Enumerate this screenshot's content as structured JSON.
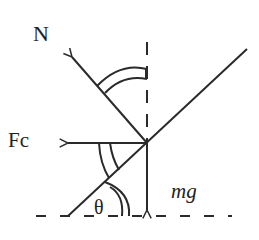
{
  "labels": {
    "normal_force": "N",
    "centripetal_force": "Fc",
    "weight": "mg",
    "angle": "θ"
  },
  "colors": {
    "stroke": "#2a2a2a",
    "background": "#ffffff"
  }
}
